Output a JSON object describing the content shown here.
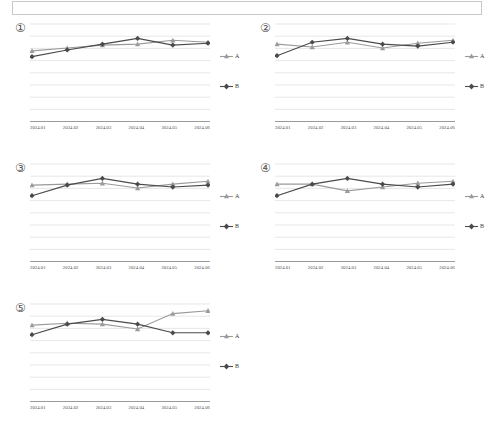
{
  "page": {
    "top_panel_label": ""
  },
  "legend": {
    "series_a_label": "A",
    "series_a_marker": "triangle-marker-icon",
    "series_b_label": "B",
    "series_b_marker": "diamond-marker-icon"
  },
  "colors": {
    "series_a": "#9a9a9a",
    "series_b": "#4a4a4a",
    "gridline": "#dcdcdc",
    "axis": "#9b9b9b",
    "text": "#3d3d3d"
  },
  "charts": [
    {
      "id": "1",
      "badge": "①",
      "chart_data": {
        "type": "line",
        "title": "",
        "xlabel": "",
        "ylabel": "",
        "categories": [
          "2024.01",
          "2024.02",
          "2024.03",
          "2024.04",
          "2024.05",
          "2024.06"
        ],
        "ylim": [
          0,
          100
        ],
        "grid": true,
        "legend_position": "right",
        "series": [
          {
            "name": "A",
            "values": [
              72,
              75,
              78,
              79,
              83,
              81
            ]
          },
          {
            "name": "B",
            "values": [
              66,
              73,
              79,
              85,
              78,
              80
            ]
          }
        ]
      }
    },
    {
      "id": "2",
      "badge": "②",
      "chart_data": {
        "type": "line",
        "title": "",
        "xlabel": "",
        "ylabel": "",
        "categories": [
          "2024.01",
          "2024.02",
          "2024.03",
          "2024.04",
          "2024.05",
          "2024.06"
        ],
        "ylim": [
          0,
          100
        ],
        "grid": true,
        "legend_position": "right",
        "series": [
          {
            "name": "A",
            "values": [
              79,
              76,
              81,
              75,
              80,
              83
            ]
          },
          {
            "name": "B",
            "values": [
              67,
              81,
              85,
              79,
              77,
              81
            ]
          }
        ]
      }
    },
    {
      "id": "3",
      "badge": "③",
      "chart_data": {
        "type": "line",
        "title": "",
        "xlabel": "",
        "ylabel": "",
        "categories": [
          "2024.01",
          "2024.02",
          "2024.03",
          "2024.04",
          "2024.05",
          "2024.06"
        ],
        "ylim": [
          0,
          100
        ],
        "grid": true,
        "legend_position": "right",
        "series": [
          {
            "name": "A",
            "values": [
              78,
              79,
              80,
              75,
              79,
              82
            ]
          },
          {
            "name": "B",
            "values": [
              67,
              78,
              85,
              79,
              76,
              78
            ]
          }
        ]
      }
    },
    {
      "id": "4",
      "badge": "④",
      "chart_data": {
        "type": "line",
        "title": "",
        "xlabel": "",
        "ylabel": "",
        "categories": [
          "2024.01",
          "2024.02",
          "2024.03",
          "2024.04",
          "2024.05",
          "2024.06"
        ],
        "ylim": [
          0,
          100
        ],
        "grid": true,
        "legend_position": "right",
        "series": [
          {
            "name": "A",
            "values": [
              79,
              79,
              72,
              76,
              80,
              82
            ]
          },
          {
            "name": "B",
            "values": [
              67,
              79,
              85,
              79,
              76,
              79
            ]
          }
        ]
      }
    },
    {
      "id": "5",
      "badge": "⑤",
      "chart_data": {
        "type": "line",
        "title": "",
        "xlabel": "",
        "ylabel": "",
        "categories": [
          "2024.01",
          "2024.02",
          "2024.03",
          "2024.04",
          "2024.05",
          "2024.06"
        ],
        "ylim": [
          0,
          100
        ],
        "grid": true,
        "legend_position": "right",
        "series": [
          {
            "name": "A",
            "values": [
              78,
              80,
              79,
              74,
              90,
              93
            ]
          },
          {
            "name": "B",
            "values": [
              68,
              79,
              84,
              79,
              70,
              70
            ]
          }
        ]
      }
    }
  ]
}
